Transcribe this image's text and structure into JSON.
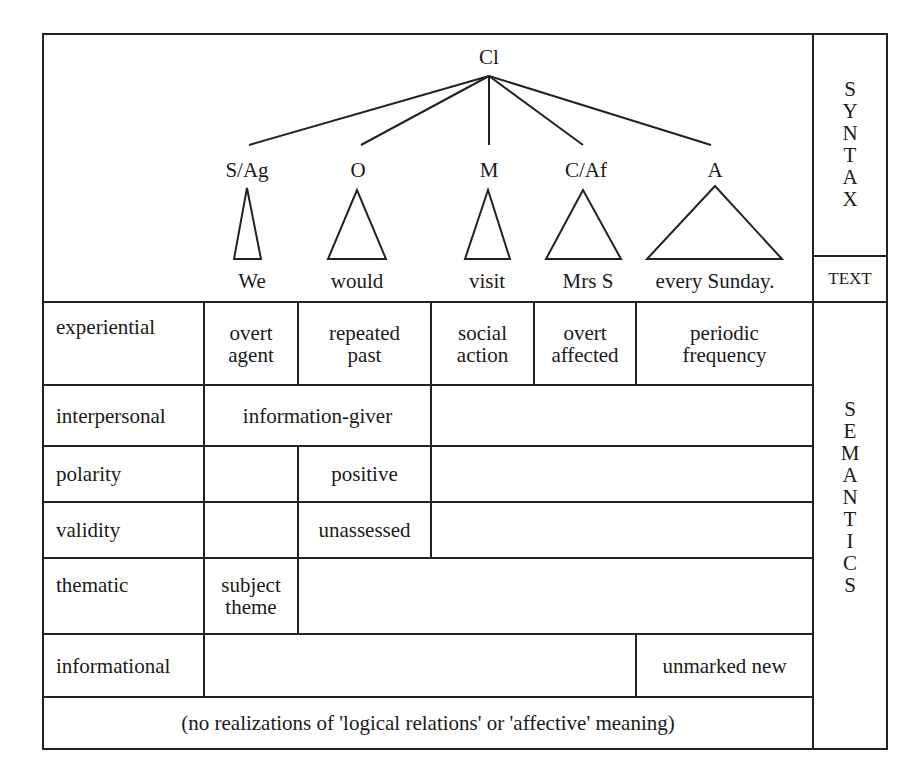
{
  "syntax_tree": {
    "root": "Cl",
    "constituents": [
      {
        "label": "S/Ag",
        "word": "We"
      },
      {
        "label": "O",
        "word": "would"
      },
      {
        "label": "M",
        "word": "visit"
      },
      {
        "label": "C/Af",
        "word": "Mrs S"
      },
      {
        "label": "A",
        "word": "every Sunday."
      }
    ]
  },
  "side_labels": {
    "syntax": [
      "S",
      "Y",
      "N",
      "T",
      "A",
      "X"
    ],
    "text": "TEXT",
    "semantics": [
      "S",
      "E",
      "M",
      "A",
      "N",
      "T",
      "I",
      "C",
      "S"
    ]
  },
  "semantics": {
    "experiential": {
      "label": "experiential",
      "cells": [
        {
          "line1": "overt",
          "line2": "agent"
        },
        {
          "line1": "repeated",
          "line2": "past"
        },
        {
          "line1": "social",
          "line2": "action"
        },
        {
          "line1": "overt",
          "line2": "affected"
        },
        {
          "line1": "periodic",
          "line2": "frequency"
        }
      ]
    },
    "interpersonal": {
      "label": "interpersonal",
      "value": "information-giver"
    },
    "polarity": {
      "label": "polarity",
      "value": "positive"
    },
    "validity": {
      "label": "validity",
      "value": "unassessed"
    },
    "thematic": {
      "label": "thematic",
      "line1": "subject",
      "line2": "theme"
    },
    "informational": {
      "label": "informational",
      "value": "unmarked new"
    },
    "footnote": "(no realizations of 'logical relations' or 'affective' meaning)"
  }
}
